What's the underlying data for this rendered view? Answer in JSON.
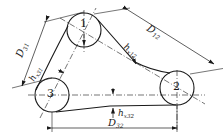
{
  "diagram": {
    "type": "belt-drive-three-pulley",
    "pulleys": [
      {
        "id": "1",
        "label": "1",
        "cx": 84,
        "cy": 30,
        "r": 17
      },
      {
        "id": "2",
        "label": "2",
        "cx": 177,
        "cy": 88,
        "r": 17
      },
      {
        "id": "3",
        "label": "3",
        "cx": 52,
        "cy": 95,
        "r": 17
      }
    ],
    "labels": {
      "D31": {
        "main": "D",
        "sub": "31"
      },
      "D12": {
        "main": "D",
        "sub": "12"
      },
      "D32": {
        "main": "D",
        "sub": "32"
      },
      "hx31": {
        "main": "h",
        "sub": "x31"
      },
      "hx12": {
        "main": "h",
        "sub": "x12"
      },
      "hx32": {
        "main": "h",
        "sub": "x32"
      }
    },
    "colors": {
      "stroke": "#1a1a1a",
      "background": "#ffffff"
    }
  }
}
